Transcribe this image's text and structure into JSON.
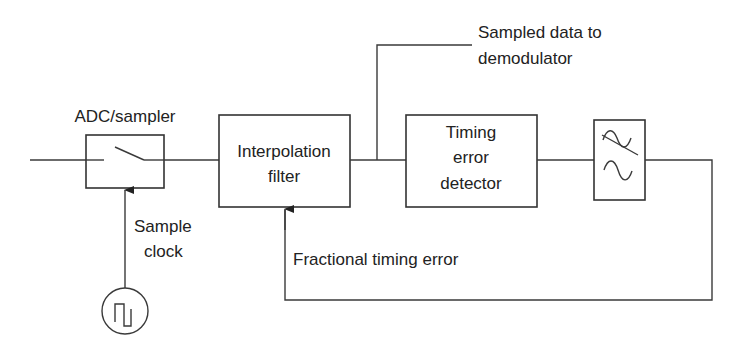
{
  "diagram": {
    "type": "block-diagram",
    "topic": "Interpolation-based timing recovery loop",
    "labels": {
      "adc": "ADC/sampler",
      "sample_clock_line1": "Sample",
      "sample_clock_line2": "clock",
      "sampled_data_line1": "Sampled data to",
      "sampled_data_line2": "demodulator",
      "fractional_error": "Fractional timing error"
    },
    "blocks": {
      "interpolation_filter": [
        "Interpolation",
        "filter"
      ],
      "timing_error_detector": [
        "Timing",
        "error",
        "detector"
      ]
    },
    "icons": {
      "switch": "switch-icon",
      "loop_filter": "lowpass-filter-icon",
      "clock_source": "square-wave-clock-icon"
    }
  }
}
